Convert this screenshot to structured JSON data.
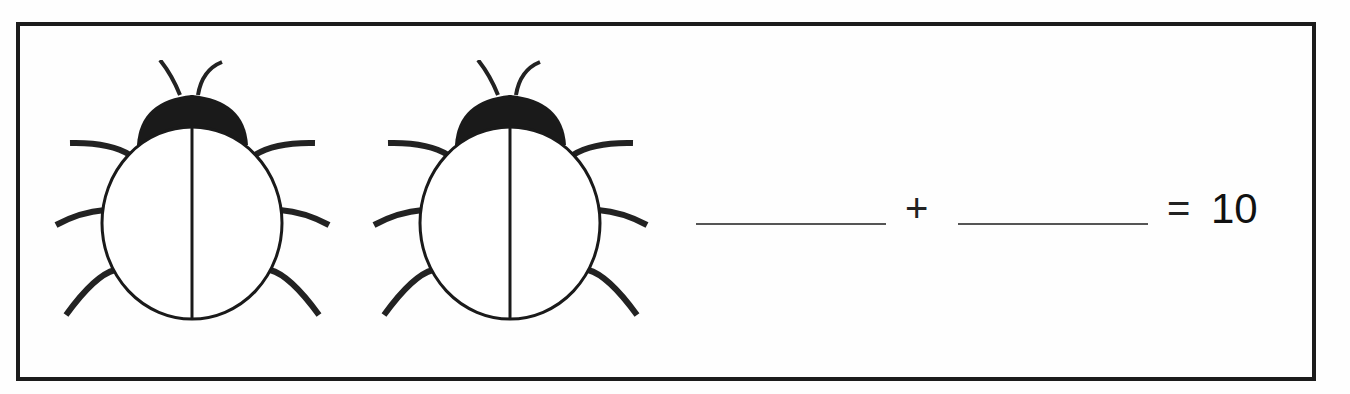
{
  "worksheet": {
    "ladybugs": [
      {
        "id": 1,
        "left_spots": 0,
        "right_spots": 0
      },
      {
        "id": 2,
        "left_spots": 0,
        "right_spots": 0
      }
    ],
    "equation": {
      "blank_1": "",
      "operator": "+",
      "blank_2": "",
      "equals": "=",
      "total": "10"
    }
  }
}
